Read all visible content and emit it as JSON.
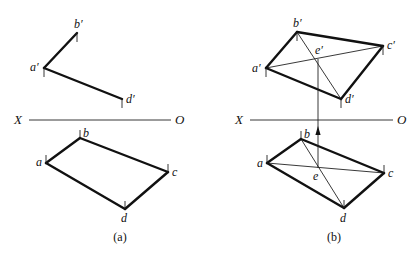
{
  "figure": {
    "colors": {
      "line": "#111111",
      "background": "#ffffff"
    },
    "panels": [
      {
        "id": "a",
        "caption": "(a)",
        "caption_pos": [
          120,
          241
        ],
        "axis": {
          "x_label": "X",
          "o_label": "O",
          "x1": 29,
          "x2": 171,
          "y": 120,
          "x_label_pos": [
            14,
            124
          ],
          "o_label_pos": [
            175,
            124
          ]
        },
        "upper_points": {
          "a'": {
            "xy": [
              44,
              68
            ],
            "label": "a′",
            "label_pos": [
              30,
              71
            ]
          },
          "b'": {
            "xy": [
              77,
              33
            ],
            "label": "b′",
            "label_pos": [
              74,
              28
            ]
          },
          "d'": {
            "xy": [
              122,
              99
            ],
            "label": "d′",
            "label_pos": [
              126,
              103
            ]
          }
        },
        "upper_edges": [
          [
            "a'",
            "b'"
          ],
          [
            "a'",
            "d'"
          ]
        ],
        "lower_points": {
          "a": {
            "xy": [
              46,
              163
            ],
            "label": "a",
            "label_pos": [
              36,
              166
            ]
          },
          "b": {
            "xy": [
              80,
              138
            ],
            "label": "b",
            "label_pos": [
              83,
              137
            ]
          },
          "c": {
            "xy": [
              168,
              172
            ],
            "label": "c",
            "label_pos": [
              172,
              176
            ]
          },
          "d": {
            "xy": [
              125,
              209
            ],
            "label": "d",
            "label_pos": [
              121,
              222
            ]
          }
        },
        "lower_edges": [
          [
            "a",
            "b"
          ],
          [
            "b",
            "c"
          ],
          [
            "c",
            "d"
          ],
          [
            "d",
            "a"
          ]
        ]
      },
      {
        "id": "b",
        "caption": "(b)",
        "caption_pos": [
          334,
          241
        ],
        "axis": {
          "x_label": "X",
          "o_label": "O",
          "x1": 250,
          "x2": 393,
          "y": 120,
          "x_label_pos": [
            235,
            124
          ],
          "o_label_pos": [
            397,
            124
          ]
        },
        "upper_points": {
          "a'": {
            "xy": [
              266,
              68
            ],
            "label": "a′",
            "label_pos": [
              252,
              72
            ]
          },
          "b'": {
            "xy": [
              297,
              32
            ],
            "label": "b′",
            "label_pos": [
              293,
              27
            ]
          },
          "c'": {
            "xy": [
              383,
              46
            ],
            "label": "c′",
            "label_pos": [
              387,
              49
            ]
          },
          "d'": {
            "xy": [
              341,
              99
            ],
            "label": "d′",
            "label_pos": [
              345,
              103
            ]
          },
          "e'": {
            "xy": [
              316,
              59
            ],
            "label": "e′",
            "label_pos": [
              315,
              54
            ]
          }
        },
        "upper_edges": [
          [
            "a'",
            "b'"
          ],
          [
            "b'",
            "c'"
          ],
          [
            "c'",
            "d'"
          ],
          [
            "d'",
            "a'"
          ]
        ],
        "upper_diagonals": [
          [
            "a'",
            "c'"
          ],
          [
            "b'",
            "d'"
          ]
        ],
        "lower_points": {
          "a": {
            "xy": [
              267,
              163
            ],
            "label": "a",
            "label_pos": [
              257,
              167
            ]
          },
          "b": {
            "xy": [
              301,
              139
            ],
            "label": "b",
            "label_pos": [
              304,
              138
            ]
          },
          "c": {
            "xy": [
              384,
              173
            ],
            "label": "c",
            "label_pos": [
              388,
              177
            ]
          },
          "d": {
            "xy": [
              344,
              208
            ],
            "label": "d",
            "label_pos": [
              340,
              222
            ]
          },
          "e": {
            "xy": [
              318,
              168
            ],
            "label": "e",
            "label_pos": [
              313,
              180
            ]
          }
        },
        "lower_edges": [
          [
            "a",
            "b"
          ],
          [
            "b",
            "c"
          ],
          [
            "c",
            "d"
          ],
          [
            "d",
            "a"
          ]
        ],
        "lower_diagonals": [
          [
            "a",
            "c"
          ],
          [
            "b",
            "d"
          ]
        ],
        "projection_line": {
          "from": [
            318,
            168
          ],
          "to": [
            318,
            59
          ],
          "arrow_tip": [
            318,
            126
          ]
        }
      }
    ]
  }
}
